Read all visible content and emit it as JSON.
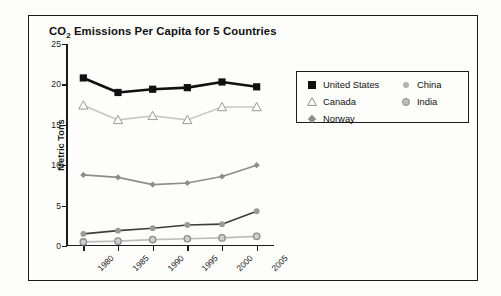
{
  "chart_data": {
    "type": "line",
    "title": "CO2 Emissions Per Capita for 5 Countries",
    "title_main": "CO",
    "title_sub": "2",
    "title_rest": " Emissions Per Capita for 5 Countries",
    "xlabel": "",
    "ylabel": "Metric Tons",
    "categories": [
      "1980",
      "1985",
      "1990",
      "1995",
      "2000",
      "2005"
    ],
    "x": [
      1980,
      1985,
      1990,
      1995,
      2000,
      2005
    ],
    "ylim": [
      0,
      25
    ],
    "yticks": [
      0,
      5,
      10,
      15,
      20,
      25
    ],
    "xtick_rotation": -45,
    "grid": false,
    "legend_position": "upper-right-inset",
    "series": [
      {
        "name": "United States",
        "marker": "filled-square",
        "color": "#111111",
        "values": [
          20.8,
          19.0,
          19.4,
          19.6,
          20.3,
          19.7
        ]
      },
      {
        "name": "Canada",
        "marker": "open-triangle",
        "color": "#c9c9c9",
        "values": [
          17.4,
          15.6,
          16.1,
          15.6,
          17.2,
          17.2
        ]
      },
      {
        "name": "Norway",
        "marker": "diamond",
        "color": "#8d8d8d",
        "values": [
          8.8,
          8.5,
          7.6,
          7.8,
          8.6,
          10.0
        ]
      },
      {
        "name": "China",
        "marker": "small-dot",
        "color": "#3d3d3d",
        "values": [
          1.5,
          1.9,
          2.2,
          2.6,
          2.7,
          4.3
        ]
      },
      {
        "name": "India",
        "marker": "ring-circle",
        "color": "#bdbdbd",
        "values": [
          0.5,
          0.6,
          0.8,
          0.9,
          1.0,
          1.2
        ]
      }
    ]
  },
  "legend": {
    "columns": [
      {
        "items": [
          {
            "label": "United States",
            "marker": "filled-square"
          },
          {
            "label": "Canada",
            "marker": "open-triangle"
          },
          {
            "label": "Norway",
            "marker": "diamond"
          }
        ]
      },
      {
        "items": [
          {
            "label": "China",
            "marker": "small-dot"
          },
          {
            "label": "India",
            "marker": "ring-circle"
          }
        ]
      }
    ]
  }
}
